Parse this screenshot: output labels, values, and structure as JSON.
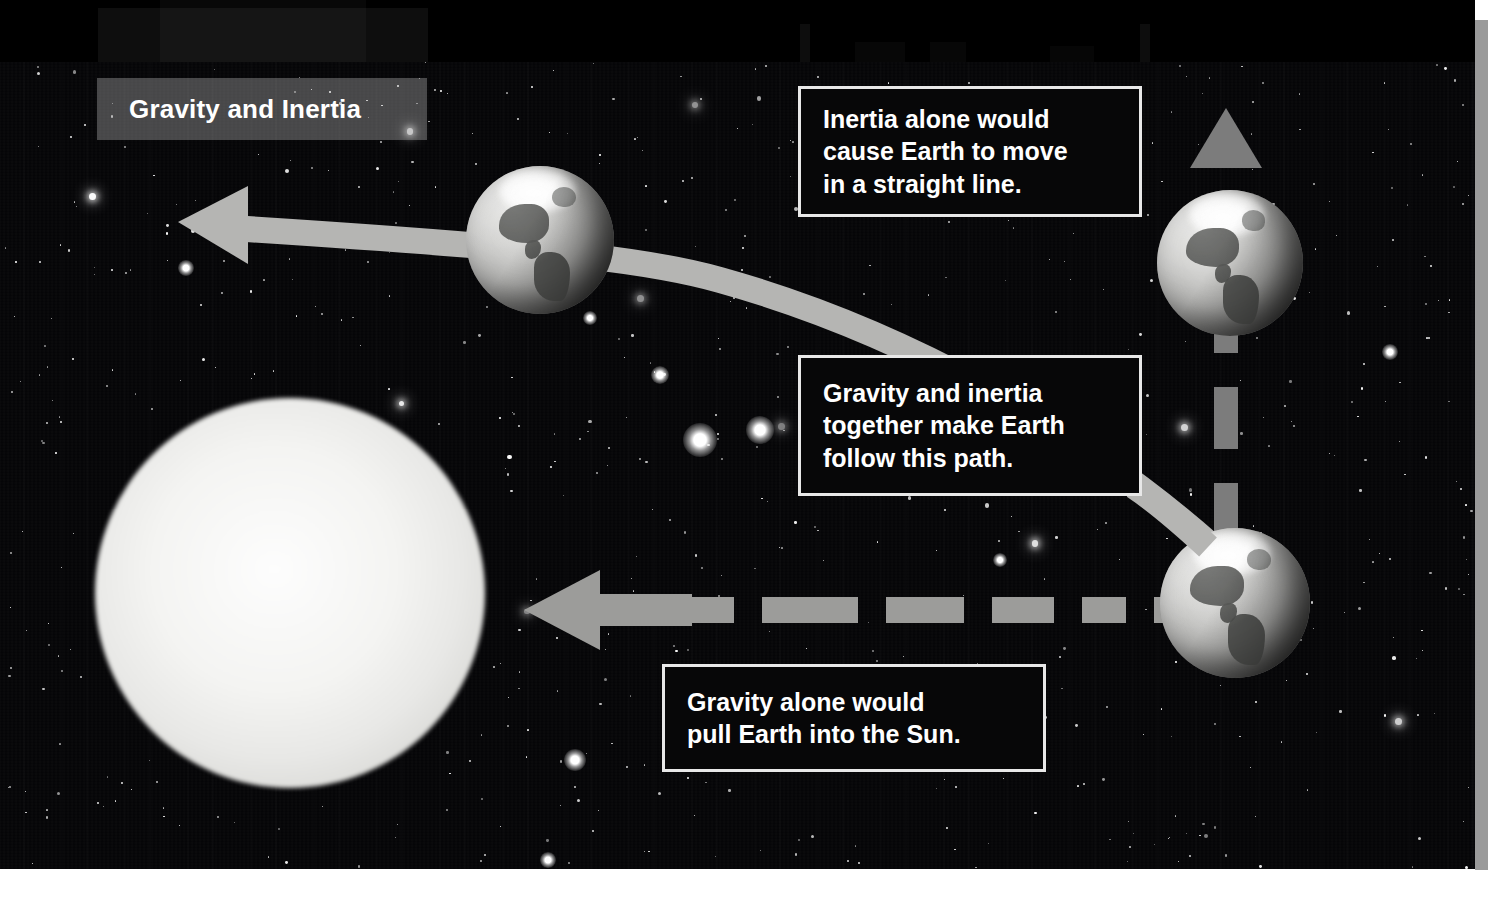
{
  "figure": {
    "title": "Gravity and Inertia",
    "domain_note": "textbook diagram of Earth orbiting the Sun"
  },
  "callouts": [
    {
      "id": "inertia",
      "name": "callout-inertia-straight-line",
      "text": "Inertia alone would\ncause Earth to move\nin a straight line."
    },
    {
      "id": "combined",
      "name": "callout-gravity-inertia-path",
      "text": "Gravity and inertia\ntogether make Earth\nfollow this path."
    },
    {
      "id": "gravity",
      "name": "callout-gravity-pull-sun",
      "text": "Gravity alone would\npull Earth into the Sun."
    }
  ],
  "bodies": [
    {
      "id": "sun",
      "label": "Sun",
      "cx": 290,
      "cy": 593,
      "r": 195
    },
    {
      "id": "earth-orbit",
      "label": "Earth",
      "cx": 540,
      "cy": 240,
      "r": 74
    },
    {
      "id": "earth-top-right",
      "label": "Earth",
      "cx": 1230,
      "cy": 263,
      "r": 73
    },
    {
      "id": "earth-bottom-right",
      "label": "Earth",
      "cx": 1235,
      "cy": 603,
      "r": 75
    }
  ],
  "arrows": [
    {
      "id": "orbit-path",
      "label": "Curved orbital path of Earth",
      "style": "solid",
      "direction": "left",
      "color": "#b5b5b3"
    },
    {
      "id": "inertia-arrow",
      "label": "Inertia straight-line arrow",
      "style": "dashed",
      "direction": "up",
      "color": "#7c7c7c"
    },
    {
      "id": "gravity-arrow",
      "label": "Gravity pull arrow toward Sun",
      "style": "dashed",
      "direction": "left",
      "color": "#9c9c9a"
    }
  ],
  "colors": {
    "space": "#050507",
    "star": "#ffffff",
    "sun": "#f4f4f2",
    "callout_border": "#e8e8e8",
    "callout_fill": "#070708",
    "title_plate": "rgba(225,225,225,0.30)",
    "text": "#ffffff",
    "orbit_path": "#b5b5b3",
    "inertia_arrow": "#7c7c7c",
    "gravity_arrow": "#9c9c9a"
  }
}
